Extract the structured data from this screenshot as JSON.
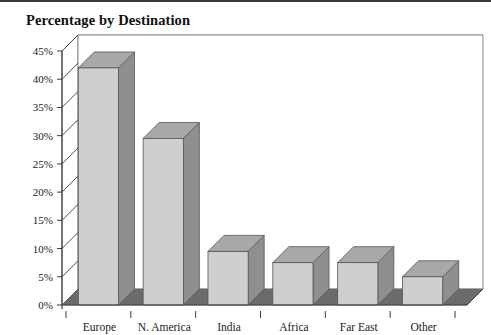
{
  "page": {
    "title": "Percentage by Destination"
  },
  "chart_data": {
    "type": "bar",
    "title": "Percentage by Destination",
    "xlabel": "",
    "ylabel": "",
    "ylim": [
      0,
      45
    ],
    "ytick_step": 5,
    "grid": true,
    "legend": "none",
    "three_d": true,
    "categories": [
      "Europe",
      "N. America",
      "India",
      "Africa",
      "Far East",
      "Other"
    ],
    "values": [
      42,
      29.5,
      9.5,
      7.5,
      7.5,
      5
    ],
    "ytick_labels": [
      "0%",
      "5%",
      "10%",
      "15%",
      "20%",
      "25%",
      "30%",
      "35%",
      "40%",
      "45%"
    ],
    "colors": {
      "bar_front": "#cfcfcf",
      "bar_top": "#a8a8a8",
      "bar_side": "#8f8f8f",
      "floor": "#6b6b6b",
      "grid": "#8a8a8a",
      "axis": "#3a3a3a",
      "plot_background": "#ffffff"
    }
  }
}
